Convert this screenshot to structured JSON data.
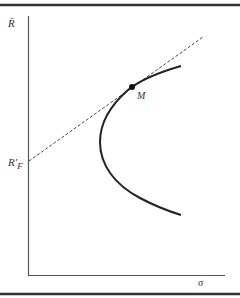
{
  "diagram": {
    "y_axis_label": "R̄",
    "x_axis_label": "σ",
    "intercept_label_main": "R′",
    "intercept_label_sub": "F",
    "point_label": "M",
    "elements": {
      "efficient_frontier": "hyperbola-shaped curve opening to the right",
      "capital_market_line": "dashed line from R'F tangent to frontier at M",
      "tangency_point": "M"
    },
    "colors": {
      "line": "#222222",
      "dashed": "#444444",
      "border": "#333333",
      "background": "#ffffff"
    }
  }
}
